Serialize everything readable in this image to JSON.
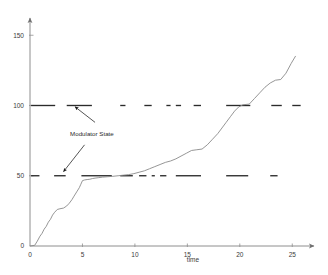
{
  "chart_data": {
    "type": "line",
    "title": "",
    "xlabel": "time",
    "ylabel": "",
    "xlim": [
      0,
      26.5
    ],
    "ylim": [
      0,
      158
    ],
    "grid": false,
    "legend": "none",
    "xticks": [
      0,
      5,
      10,
      15,
      20,
      25
    ],
    "xtick_labels": [
      "0",
      "5",
      "10",
      "15",
      "20",
      "25"
    ],
    "yticks": [
      0,
      50,
      100,
      150
    ],
    "ytick_labels": [
      "0",
      "50",
      "100",
      "150"
    ],
    "axis_style": "arrow-tipped L-shaped spines",
    "series": [
      {
        "name": "signal",
        "style": "solid thin staircase",
        "color": "#8a8a8a",
        "x": [
          0.0,
          0.45,
          0.7,
          0.95,
          1.15,
          1.35,
          1.55,
          1.75,
          1.95,
          2.15,
          2.35,
          2.6,
          2.85,
          3.2,
          3.5,
          3.75,
          4.0,
          4.2,
          4.45,
          4.7,
          4.85,
          5.0,
          5.2,
          5.45,
          5.7,
          5.95,
          6.2,
          6.5,
          6.9,
          7.4,
          7.9,
          8.4,
          8.9,
          9.4,
          9.9,
          10.4,
          10.9,
          11.4,
          11.9,
          12.4,
          12.9,
          13.4,
          13.9,
          14.4,
          14.9,
          15.4,
          15.9,
          16.4,
          16.9,
          17.4,
          17.9,
          18.3,
          18.7,
          19.1,
          19.5,
          19.9,
          20.3,
          20.9,
          21.4,
          21.9,
          22.4,
          22.9,
          23.4,
          23.9,
          24.4,
          24.9,
          25.3
        ],
        "y": [
          0.0,
          0.5,
          3.5,
          7.0,
          9.0,
          12.0,
          14.0,
          17.0,
          19.0,
          22.0,
          24.0,
          26.0,
          26.5,
          27.0,
          28.5,
          30.5,
          33.0,
          35.5,
          38.5,
          41.5,
          44.0,
          46.5,
          47.0,
          47.3,
          47.5,
          48.0,
          48.3,
          48.6,
          49.0,
          49.3,
          49.6,
          50.0,
          50.4,
          50.8,
          51.5,
          52.5,
          53.5,
          55.0,
          56.5,
          58.0,
          59.5,
          60.5,
          62.0,
          64.0,
          66.0,
          68.0,
          68.5,
          69.0,
          72.0,
          76.0,
          80.0,
          84.0,
          88.0,
          92.0,
          96.0,
          99.0,
          100.5,
          101.0,
          105.0,
          109.0,
          113.0,
          116.0,
          118.0,
          118.5,
          123.0,
          130.0,
          135.0
        ]
      },
      {
        "name": "modulator-state-high",
        "style": "dashed",
        "color": "#2b2b2b",
        "level": 100,
        "segments": [
          [
            0.1,
            2.4
          ],
          [
            3.5,
            5.9
          ],
          [
            8.6,
            9.1
          ],
          [
            10.9,
            11.6
          ],
          [
            13.0,
            13.4
          ],
          [
            13.9,
            14.4
          ],
          [
            15.6,
            16.3
          ],
          [
            18.7,
            21.0
          ],
          [
            23.0,
            24.0
          ],
          [
            25.0,
            25.8
          ]
        ]
      },
      {
        "name": "modulator-state-low",
        "style": "dashed",
        "color": "#2b2b2b",
        "level": 50,
        "segments": [
          [
            0.1,
            0.9
          ],
          [
            2.3,
            3.4
          ],
          [
            4.9,
            7.8
          ],
          [
            8.6,
            9.8
          ],
          [
            10.4,
            11.1
          ],
          [
            11.6,
            11.9
          ],
          [
            12.4,
            13.0
          ],
          [
            13.9,
            16.3
          ],
          [
            18.7,
            20.8
          ],
          [
            22.9,
            23.6
          ]
        ]
      }
    ],
    "annotations": [
      {
        "text": "Modulator State",
        "text_x": 5.9,
        "text_y": 78,
        "arrows": [
          {
            "from_x": 6.2,
            "from_y": 88,
            "to_x": 4.3,
            "to_y": 99
          },
          {
            "from_x": 5.2,
            "from_y": 72,
            "to_x": 3.2,
            "to_y": 53
          }
        ]
      }
    ]
  },
  "axis": {
    "x_title": "time",
    "y_title": ""
  }
}
